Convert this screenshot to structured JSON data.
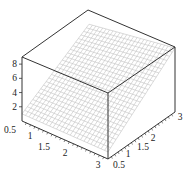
{
  "chart_data": {
    "type": "surface3d",
    "title": "",
    "xlabel": "",
    "ylabel": "",
    "zlabel": "",
    "x_range": [
      0.5,
      3
    ],
    "y_range": [
      0.5,
      3
    ],
    "z_range": [
      0,
      9
    ],
    "x_ticks": [
      "0.5",
      "1",
      "1.5",
      "2",
      "3"
    ],
    "y_ticks": [
      "0.5",
      "1",
      "1.5",
      "2",
      "3"
    ],
    "z_ticks": [
      "2",
      "4",
      "6",
      "8"
    ],
    "surface": {
      "style": "wireframe mesh",
      "description": "Surface rising from about z≈1 at front-left to about z≈7-8 at the back-right corner",
      "corner_values": {
        "x0.5_y0.5": 1,
        "x3_y0.5": 1,
        "x0.5_y3": 7,
        "x3_y3": 9
      },
      "grid_lines": 25
    },
    "box": "full bounding box drawn",
    "colors": {
      "axes": "#333333",
      "mesh": "#b8b8b8"
    }
  }
}
